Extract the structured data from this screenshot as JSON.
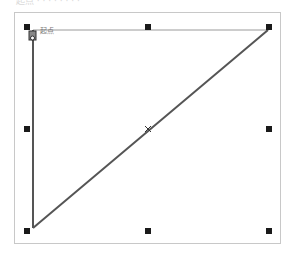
{
  "header": {
    "faint_text": "起点 · · · · · · · ·"
  },
  "canvas": {
    "frame_color": "#c8c8c8",
    "line_color": "#555555",
    "guide_color": "#9a9a9a",
    "handle_color": "#1a1a1a",
    "start_label": "起点",
    "shapes": [
      {
        "type": "line",
        "name": "vertical-edge",
        "from": [
          33,
          30
        ],
        "to": [
          33,
          228
        ]
      },
      {
        "type": "line",
        "name": "diagonal-edge",
        "from": [
          33,
          228
        ],
        "to": [
          268,
          30
        ]
      },
      {
        "type": "line",
        "name": "top-guide",
        "from": [
          33,
          30
        ],
        "to": [
          268,
          30
        ]
      }
    ],
    "handles": [
      {
        "pos": "top-left",
        "x": 27,
        "y": 27
      },
      {
        "pos": "top-center",
        "x": 148,
        "y": 27
      },
      {
        "pos": "top-right",
        "x": 269,
        "y": 27
      },
      {
        "pos": "middle-left",
        "x": 27,
        "y": 129
      },
      {
        "pos": "middle-right",
        "x": 269,
        "y": 129
      },
      {
        "pos": "bottom-left",
        "x": 27,
        "y": 231
      },
      {
        "pos": "bottom-center",
        "x": 148,
        "y": 231
      },
      {
        "pos": "bottom-right",
        "x": 269,
        "y": 231
      }
    ],
    "midpoint_marker": {
      "x": 148,
      "y": 129
    }
  }
}
